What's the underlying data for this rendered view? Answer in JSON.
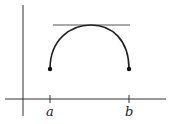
{
  "diagram": {
    "labels": {
      "a": "a",
      "b": "b"
    },
    "colors": {
      "stroke": "#222222",
      "tangent": "#555555"
    }
  }
}
